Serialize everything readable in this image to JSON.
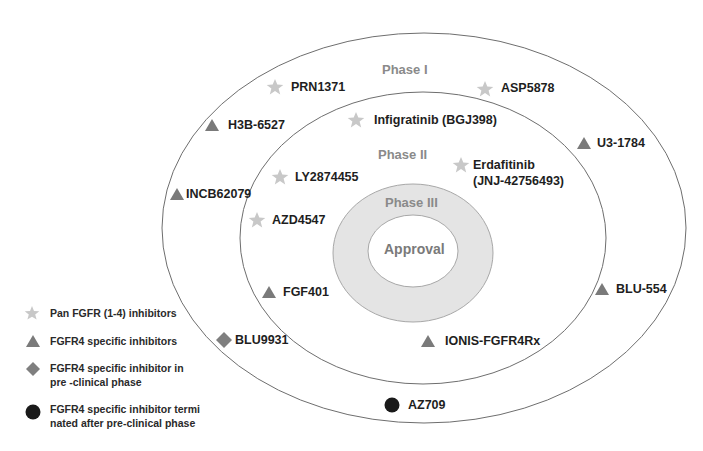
{
  "diagram": {
    "phases": {
      "phase1": "Phase I",
      "phase2": "Phase II",
      "phase3": "Phase III",
      "approval": "Approval"
    },
    "colors": {
      "star": "#c8c8c8",
      "triangle": "#7a7a7a",
      "diamond": "#7f7f7f",
      "circle": "#1a1a1a",
      "phase3_fill": "#e4e4e4",
      "ring_stroke": "#6e6e6e"
    },
    "drugs": [
      {
        "name": "PRN1371",
        "type": "star",
        "phase": "Phase I"
      },
      {
        "name": "ASP5878",
        "type": "star",
        "phase": "Phase I"
      },
      {
        "name": "H3B-6527",
        "type": "triangle",
        "phase": "Phase I"
      },
      {
        "name": "U3-1784",
        "type": "triangle",
        "phase": "Phase I"
      },
      {
        "name": "INCB62079",
        "type": "triangle",
        "phase": "Phase I"
      },
      {
        "name": "BLU-554",
        "type": "triangle",
        "phase": "Phase I"
      },
      {
        "name": "BLU9931",
        "type": "diamond",
        "phase": "Pre-clinical"
      },
      {
        "name": "AZ709",
        "type": "circle",
        "phase": "Terminated"
      },
      {
        "name": "Infigratinib (BGJ398)",
        "type": "star",
        "phase": "Phase II"
      },
      {
        "name": "LY2874455",
        "type": "star",
        "phase": "Phase II"
      },
      {
        "name": "Erdafitinib",
        "name_line2": "(JNJ-42756493)",
        "type": "star",
        "phase": "Phase II"
      },
      {
        "name": "AZD4547",
        "type": "star",
        "phase": "Phase II"
      },
      {
        "name": "FGF401",
        "type": "triangle",
        "phase": "Phase II"
      },
      {
        "name": "IONIS-FGFR4Rx",
        "type": "triangle",
        "phase": "Phase II"
      }
    ]
  },
  "legend": {
    "items": [
      {
        "icon": "star",
        "text": "Pan FGFR (1-4) inhibitors"
      },
      {
        "icon": "triangle",
        "text": "FGFR4 specific inhibitors"
      },
      {
        "icon": "diamond",
        "text": "FGFR4 specific inhibitor in pre -clinical phase"
      },
      {
        "icon": "circle",
        "text": "FGFR4 specific inhibitor termi nated after pre-clinical phase"
      }
    ]
  }
}
